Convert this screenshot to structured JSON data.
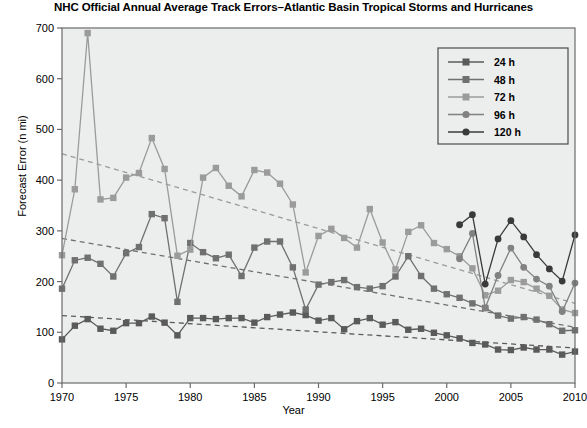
{
  "chart_data": {
    "type": "line",
    "title": "NHC Official Annual Average Track Errors–Atlantic Basin Tropical Storms and Hurricanes",
    "xlabel": "Year",
    "ylabel": "Forecast Error (n mi)",
    "xlim": [
      1970,
      2010
    ],
    "ylim": [
      0,
      700
    ],
    "xticks": [
      1970,
      1975,
      1980,
      1985,
      1990,
      1995,
      2000,
      2005,
      2010
    ],
    "yticks": [
      0,
      100,
      200,
      300,
      400,
      500,
      600,
      700
    ],
    "grid": false,
    "legend_position": "upper right",
    "x": [
      1970,
      1971,
      1972,
      1973,
      1974,
      1975,
      1976,
      1977,
      1978,
      1979,
      1980,
      1981,
      1982,
      1983,
      1984,
      1985,
      1986,
      1987,
      1988,
      1989,
      1990,
      1991,
      1992,
      1993,
      1994,
      1995,
      1996,
      1997,
      1998,
      1999,
      2000,
      2001,
      2002,
      2003,
      2004,
      2005,
      2006,
      2007,
      2008,
      2009,
      2010
    ],
    "series": [
      {
        "name": "24 h",
        "label": "24 h",
        "color": "#5a5a5a",
        "marker": "square",
        "values": [
          86,
          113,
          126,
          107,
          103,
          118,
          118,
          131,
          119,
          94,
          128,
          128,
          126,
          128,
          128,
          119,
          130,
          135,
          139,
          134,
          123,
          128,
          106,
          122,
          128,
          115,
          120,
          105,
          107,
          99,
          94,
          88,
          79,
          76,
          66,
          65,
          70,
          66,
          66,
          56,
          62
        ]
      },
      {
        "name": "48 h",
        "label": "48 h",
        "color": "#707070",
        "marker": "square",
        "values": [
          186,
          242,
          247,
          235,
          210,
          256,
          268,
          333,
          325,
          160,
          276,
          258,
          246,
          253,
          211,
          267,
          279,
          279,
          228,
          145,
          194,
          199,
          203,
          189,
          186,
          191,
          210,
          250,
          211,
          186,
          175,
          168,
          157,
          148,
          133,
          127,
          130,
          125,
          116,
          103,
          104
        ]
      },
      {
        "name": "72 h",
        "label": "72 h",
        "color": "#9b9b9b",
        "marker": "square",
        "values": [
          252,
          382,
          690,
          362,
          365,
          405,
          414,
          483,
          422,
          251,
          263,
          405,
          424,
          389,
          368,
          420,
          415,
          393,
          352,
          218,
          290,
          304,
          286,
          267,
          343,
          277,
          224,
          298,
          311,
          276,
          264,
          250,
          226,
          173,
          182,
          203,
          199,
          186,
          172,
          145,
          138
        ]
      },
      {
        "name": "96 h",
        "label": "96 h",
        "color": "#818181",
        "marker": "circle",
        "values": [
          null,
          null,
          null,
          null,
          null,
          null,
          null,
          null,
          null,
          null,
          null,
          null,
          null,
          null,
          null,
          null,
          null,
          null,
          null,
          null,
          null,
          null,
          null,
          null,
          null,
          null,
          null,
          null,
          null,
          null,
          null,
          245,
          295,
          148,
          212,
          266,
          228,
          205,
          191,
          141,
          197
        ]
      },
      {
        "name": "120 h",
        "label": "120 h",
        "color": "#3a3a3a",
        "marker": "circle",
        "values": [
          null,
          null,
          null,
          null,
          null,
          null,
          null,
          null,
          null,
          null,
          null,
          null,
          null,
          null,
          null,
          null,
          null,
          null,
          null,
          null,
          null,
          null,
          null,
          null,
          null,
          null,
          null,
          null,
          null,
          null,
          null,
          312,
          332,
          195,
          284,
          320,
          288,
          253,
          225,
          201,
          292
        ]
      }
    ],
    "trendlines": [
      {
        "name": "24 h trend",
        "color": "#5a5a5a",
        "x": [
          1970,
          2010
        ],
        "y": [
          133,
          69
        ]
      },
      {
        "name": "48 h trend",
        "color": "#707070",
        "x": [
          1970,
          2010
        ],
        "y": [
          285,
          110
        ]
      },
      {
        "name": "72 h trend",
        "color": "#9b9b9b",
        "x": [
          1970,
          2010
        ],
        "y": [
          452,
          157
        ]
      }
    ]
  }
}
